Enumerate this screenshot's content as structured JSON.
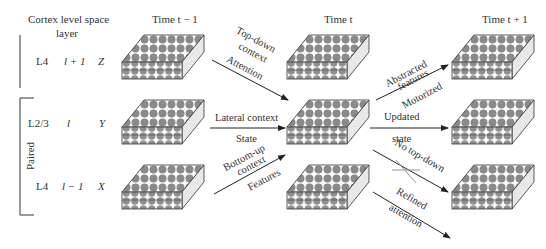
{
  "headers": {
    "cortex": "Cortex level space",
    "layer": "layer",
    "time_prev": "Time t − 1",
    "time_now": "Time t",
    "time_next": "Time t + 1"
  },
  "rows": [
    {
      "cortex": "L4",
      "level": "l + 1",
      "space": "Z"
    },
    {
      "cortex": "L2/3",
      "level": "l",
      "space": "Y"
    },
    {
      "cortex": "L4",
      "level": "l − 1",
      "space": "X"
    }
  ],
  "paired_label": "Paired",
  "arrows": {
    "topdown_1": "Top-down",
    "topdown_2": "context",
    "topdown_3": "Attention",
    "lateral_1": "Lateral context",
    "lateral_2": "State",
    "bottomup_1": "Bottom-up",
    "bottomup_2": "context",
    "bottomup_3": "Features",
    "abstracted_1": "Abstracted",
    "abstracted_2": "features",
    "abstracted_3": "Motorized",
    "updated_1": "Updated",
    "updated_2": "state",
    "notopdown": "No top-down",
    "refined_1": "Refined",
    "refined_2": "attention"
  }
}
